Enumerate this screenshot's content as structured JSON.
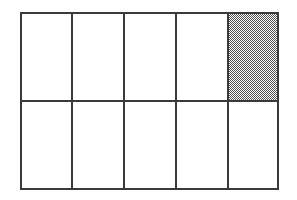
{
  "figure": {
    "name": "fraction-area-grid",
    "canvas": {
      "width": 297,
      "height": 200,
      "background": "#fefefe"
    },
    "grid": {
      "columns": 5,
      "rows": 2,
      "total_cells": 10,
      "shaded_cells": 1,
      "unshaded_cells": 9,
      "fraction_shaded": "1/10",
      "bounds": {
        "x": 20,
        "y": 12,
        "width": 259,
        "height": 178
      },
      "column_edges": [
        20,
        72,
        124,
        176,
        228,
        279
      ],
      "row_edges": [
        12,
        101,
        190
      ],
      "line_color": "#3a3a3a",
      "line_width": 2,
      "cell_fill": "#ffffff",
      "shade_color": "#8e8e8e",
      "shade_pattern": "checkerboard-dither"
    },
    "cells": [
      {
        "id": "cell-r1c1",
        "row": 1,
        "col": 1,
        "shaded": false
      },
      {
        "id": "cell-r1c2",
        "row": 1,
        "col": 2,
        "shaded": false
      },
      {
        "id": "cell-r1c3",
        "row": 1,
        "col": 3,
        "shaded": false
      },
      {
        "id": "cell-r1c4",
        "row": 1,
        "col": 4,
        "shaded": false
      },
      {
        "id": "cell-r1c5",
        "row": 1,
        "col": 5,
        "shaded": true
      },
      {
        "id": "cell-r2c1",
        "row": 2,
        "col": 1,
        "shaded": false
      },
      {
        "id": "cell-r2c2",
        "row": 2,
        "col": 2,
        "shaded": false
      },
      {
        "id": "cell-r2c3",
        "row": 2,
        "col": 3,
        "shaded": false
      },
      {
        "id": "cell-r2c4",
        "row": 2,
        "col": 4,
        "shaded": false
      },
      {
        "id": "cell-r2c5",
        "row": 2,
        "col": 5,
        "shaded": false
      }
    ]
  }
}
